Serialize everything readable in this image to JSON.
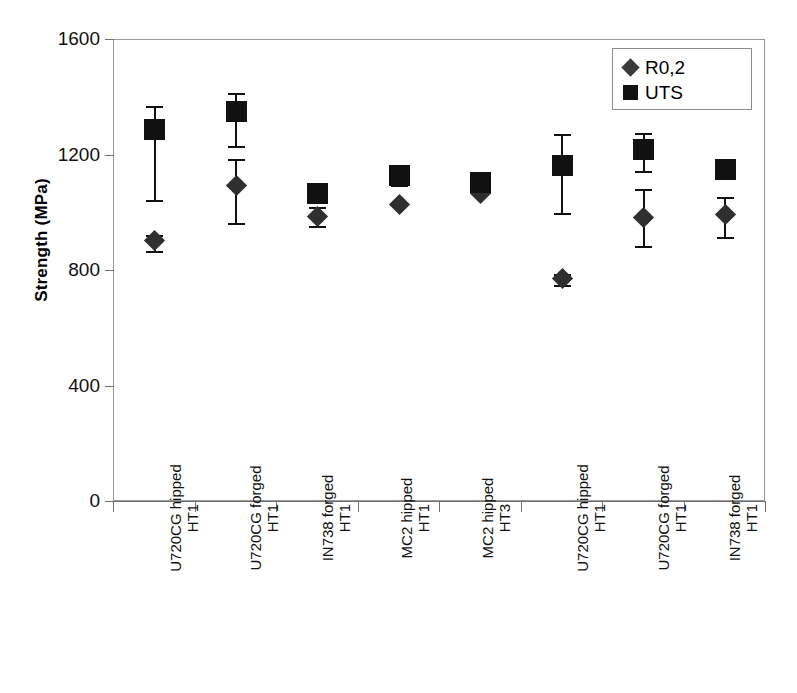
{
  "chart_data": {
    "type": "scatter",
    "title": "",
    "xlabel": "",
    "ylabel": "Strength (MPa)",
    "ylim": [
      0,
      1600
    ],
    "yticks": [
      0,
      400,
      800,
      1200,
      1600
    ],
    "grid": false,
    "legend_position": "top-right",
    "categories": [
      {
        "line1": "U720CG hipped",
        "line2": "HT1"
      },
      {
        "line1": "U720CG forged",
        "line2": "HT1"
      },
      {
        "line1": "IN738 forged",
        "line2": "HT1"
      },
      {
        "line1": "MC2 hipped",
        "line2": "HT1"
      },
      {
        "line1": "MC2 hipped",
        "line2": "HT3"
      },
      {
        "line1": "U720CG hipped",
        "line2": "HT1"
      },
      {
        "line1": "U720CG forged",
        "line2": "HT1"
      },
      {
        "line1": "IN738 forged",
        "line2": "HT1"
      }
    ],
    "series": [
      {
        "name": "R0,2",
        "marker": "diamond",
        "color": "#2f2f2f",
        "values": [
          905,
          1095,
          990,
          1032,
          1070,
          773,
          987,
          994
        ],
        "err_high": [
          925,
          1187,
          1020,
          1032,
          1070,
          790,
          1084,
          1057
        ],
        "err_low": [
          870,
          967,
          955,
          1032,
          1070,
          752,
          886,
          918
        ]
      },
      {
        "name": "UTS",
        "marker": "square",
        "color": "#111111",
        "values": [
          1290,
          1353,
          1070,
          1130,
          1105,
          1165,
          1222,
          1153
        ],
        "err_high": [
          1372,
          1415,
          1100,
          1168,
          1105,
          1275,
          1278,
          1153
        ],
        "err_low": [
          1046,
          1234,
          1040,
          1098,
          1105,
          1001,
          1147,
          1153
        ]
      }
    ]
  },
  "legend": {
    "items": [
      {
        "label": "R0,2",
        "marker": "diamond"
      },
      {
        "label": "UTS",
        "marker": "square"
      }
    ]
  }
}
